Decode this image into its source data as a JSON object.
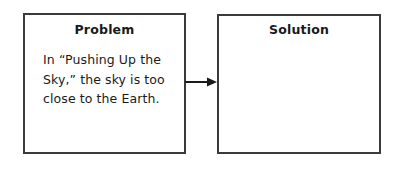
{
  "diagram": {
    "type": "problem-solution graphic organizer",
    "problem": {
      "title": "Problem",
      "text": "In “Pushing Up the Sky,” the sky is too close to the Earth."
    },
    "connector": {
      "icon": "right-arrow-icon",
      "from": "problem",
      "to": "solution"
    },
    "solution": {
      "title": "Solution",
      "text": ""
    },
    "colors": {
      "border": "#3a3a3a",
      "text": "#1a1a1a",
      "background": "#ffffff"
    }
  }
}
